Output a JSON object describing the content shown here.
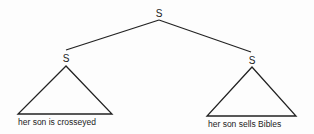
{
  "tree": {
    "root": {
      "label": "S"
    },
    "children": [
      {
        "label": "S",
        "yield": "her son is crosseyed"
      },
      {
        "label": "S",
        "yield": "her son sells Bibles"
      }
    ]
  },
  "colors": {
    "ink": "#222222",
    "background": "#fdfdfd"
  }
}
